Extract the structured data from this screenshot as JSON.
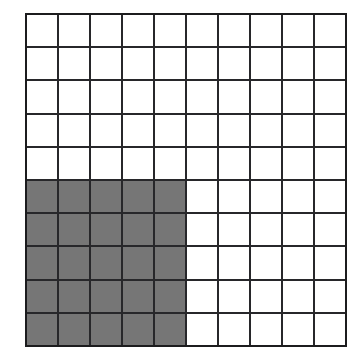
{
  "figure": {
    "name": "shaded-fraction-grid",
    "background_color": "#ffffff"
  },
  "chart_data": {
    "type": "heatmap",
    "title": "",
    "subtitle": "",
    "xlabel": "",
    "ylabel": "",
    "columns": 10,
    "rows": 10,
    "total_cells": 100,
    "shaded_cells": 25,
    "shaded_fraction": "25/100",
    "shaded_percent": 25,
    "grid": true,
    "legend": "none",
    "colors": {
      "shaded": "#767676",
      "unshaded": "#ffffff",
      "gridline": "#27272a",
      "outer_border": "#1c1c1e"
    },
    "column_labels": [
      "1",
      "2",
      "3",
      "4",
      "5",
      "6",
      "7",
      "8",
      "9",
      "10"
    ],
    "row_labels": [
      "1",
      "2",
      "3",
      "4",
      "5",
      "6",
      "7",
      "8",
      "9",
      "10"
    ],
    "shaded_region": {
      "row_start": 6,
      "row_end": 10,
      "col_start": 1,
      "col_end": 5
    },
    "values": [
      [
        0,
        0,
        0,
        0,
        0,
        0,
        0,
        0,
        0,
        0
      ],
      [
        0,
        0,
        0,
        0,
        0,
        0,
        0,
        0,
        0,
        0
      ],
      [
        0,
        0,
        0,
        0,
        0,
        0,
        0,
        0,
        0,
        0
      ],
      [
        0,
        0,
        0,
        0,
        0,
        0,
        0,
        0,
        0,
        0
      ],
      [
        0,
        0,
        0,
        0,
        0,
        0,
        0,
        0,
        0,
        0
      ],
      [
        1,
        1,
        1,
        1,
        1,
        0,
        0,
        0,
        0,
        0
      ],
      [
        1,
        1,
        1,
        1,
        1,
        0,
        0,
        0,
        0,
        0
      ],
      [
        1,
        1,
        1,
        1,
        1,
        0,
        0,
        0,
        0,
        0
      ],
      [
        1,
        1,
        1,
        1,
        1,
        0,
        0,
        0,
        0,
        0
      ],
      [
        1,
        1,
        1,
        1,
        1,
        0,
        0,
        0,
        0,
        0
      ]
    ]
  }
}
